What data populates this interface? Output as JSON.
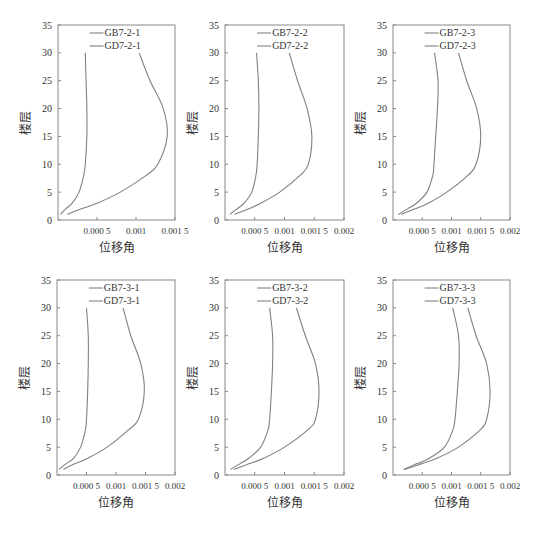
{
  "figure": {
    "y_axis_label": "楼层",
    "x_axis_label": "位移角",
    "line_color": "#808080"
  },
  "chart_data": [
    {
      "type": "line",
      "title": "",
      "xlabel": "位移角",
      "ylabel": "楼层",
      "xlim": [
        0,
        0.0015
      ],
      "ylim": [
        0,
        35
      ],
      "xticks": [
        "0.000 5",
        "0.001",
        "0.001 5"
      ],
      "xtick_values": [
        0.0005,
        0.001,
        0.0015
      ],
      "yticks": [
        "0",
        "5",
        "10",
        "15",
        "20",
        "25",
        "30",
        "35"
      ],
      "legend": [
        "GB7-2-1",
        "GD7-2-1"
      ],
      "legend_position": "upper center",
      "grid": false,
      "series": [
        {
          "name": "GB7-2-1",
          "y": [
            1,
            2,
            3,
            5,
            8,
            10,
            15,
            20,
            25,
            30
          ],
          "x": [
            3e-05,
            0.0001,
            0.00018,
            0.00027,
            0.00033,
            0.00035,
            0.00037,
            0.00037,
            0.00036,
            0.00035
          ]
        },
        {
          "name": "GD7-2-1",
          "y": [
            1,
            2,
            3,
            5,
            8,
            10,
            15,
            20,
            25,
            30
          ],
          "x": [
            0.00012,
            0.0003,
            0.0005,
            0.0008,
            0.00113,
            0.00128,
            0.0014,
            0.00135,
            0.00118,
            0.00104
          ]
        }
      ]
    },
    {
      "type": "line",
      "title": "",
      "xlabel": "位移角",
      "ylabel": "楼层",
      "xlim": [
        0,
        0.002
      ],
      "ylim": [
        0,
        35
      ],
      "xticks": [
        "0.000 5",
        "0.001",
        "0.001 5",
        "0.002"
      ],
      "xtick_values": [
        0.0005,
        0.001,
        0.0015,
        0.002
      ],
      "yticks": [
        "0",
        "5",
        "10",
        "15",
        "20",
        "25",
        "30",
        "35"
      ],
      "legend": [
        "GB7-2-2",
        "GD7-2-2"
      ],
      "legend_position": "upper center",
      "grid": false,
      "series": [
        {
          "name": "GB7-2-2",
          "y": [
            1,
            2,
            3,
            5,
            8,
            10,
            15,
            20,
            25,
            30
          ],
          "x": [
            8e-05,
            0.0002,
            0.00032,
            0.00045,
            0.00052,
            0.00054,
            0.00056,
            0.00057,
            0.00056,
            0.00053
          ]
        },
        {
          "name": "GD7-2-2",
          "y": [
            1,
            2,
            3,
            5,
            8,
            10,
            15,
            20,
            25,
            30
          ],
          "x": [
            0.00016,
            0.0004,
            0.0006,
            0.00092,
            0.00126,
            0.0014,
            0.00146,
            0.00138,
            0.00122,
            0.00108
          ]
        }
      ]
    },
    {
      "type": "line",
      "title": "",
      "xlabel": "位移角",
      "ylabel": "楼层",
      "xlim": [
        0,
        0.002
      ],
      "ylim": [
        0,
        35
      ],
      "xticks": [
        "0.000 5",
        "0.001",
        "0.001 5",
        "0.002"
      ],
      "xtick_values": [
        0.0005,
        0.001,
        0.0015,
        0.002
      ],
      "yticks": [
        "0",
        "5",
        "10",
        "15",
        "20",
        "25",
        "30",
        "35"
      ],
      "legend": [
        "GB7-2-3",
        "GD7-2-3"
      ],
      "legend_position": "upper center",
      "grid": false,
      "series": [
        {
          "name": "GB7-2-3",
          "y": [
            1,
            2,
            3,
            5,
            8,
            10,
            15,
            20,
            25,
            30
          ],
          "x": [
            9e-05,
            0.00025,
            0.0004,
            0.00058,
            0.00068,
            0.0007,
            0.00073,
            0.00076,
            0.00077,
            0.00071
          ]
        },
        {
          "name": "GD7-2-3",
          "y": [
            1,
            2,
            3,
            5,
            8,
            10,
            15,
            20,
            25,
            30
          ],
          "x": [
            0.00014,
            0.00038,
            0.0006,
            0.00092,
            0.00128,
            0.00142,
            0.0015,
            0.00143,
            0.00126,
            0.00112
          ]
        }
      ]
    },
    {
      "type": "line",
      "title": "",
      "xlabel": "位移角",
      "ylabel": "楼层",
      "xlim": [
        0,
        0.002
      ],
      "ylim": [
        0,
        35
      ],
      "xticks": [
        "0.000 5",
        "0.001",
        "0.001 5",
        "0.002"
      ],
      "xtick_values": [
        0.0005,
        0.001,
        0.0015,
        0.002
      ],
      "yticks": [
        "0",
        "5",
        "10",
        "15",
        "20",
        "25",
        "30",
        "35"
      ],
      "legend": [
        "GB7-3-1",
        "GD7-3-1"
      ],
      "legend_position": "upper center",
      "grid": false,
      "series": [
        {
          "name": "GB7-3-1",
          "y": [
            1,
            2,
            3,
            5,
            8,
            10,
            15,
            20,
            25,
            30
          ],
          "x": [
            3e-05,
            0.00015,
            0.00028,
            0.0004,
            0.00048,
            0.0005,
            0.00052,
            0.00053,
            0.00053,
            0.0005
          ]
        },
        {
          "name": "GD7-3-1",
          "y": [
            1,
            2,
            3,
            5,
            8,
            10,
            15,
            20,
            25,
            30
          ],
          "x": [
            0.00011,
            0.0003,
            0.00052,
            0.00085,
            0.0012,
            0.00138,
            0.00148,
            0.00142,
            0.00125,
            0.00112
          ]
        }
      ]
    },
    {
      "type": "line",
      "title": "",
      "xlabel": "位移角",
      "ylabel": "楼层",
      "xlim": [
        0,
        0.002
      ],
      "ylim": [
        0,
        35
      ],
      "xticks": [
        "0.000 5",
        "0.001",
        "0.001 5",
        "0.002"
      ],
      "xtick_values": [
        0.0005,
        0.001,
        0.0015,
        0.002
      ],
      "yticks": [
        "0",
        "5",
        "10",
        "15",
        "20",
        "25",
        "30",
        "35"
      ],
      "legend": [
        "GB7-3-2",
        "GD7-3-2"
      ],
      "legend_position": "upper center",
      "grid": false,
      "series": [
        {
          "name": "GB7-3-2",
          "y": [
            1,
            2,
            3,
            5,
            8,
            10,
            15,
            20,
            25,
            30
          ],
          "x": [
            9e-05,
            0.00025,
            0.0004,
            0.0006,
            0.00072,
            0.00075,
            0.00078,
            0.0008,
            0.0008,
            0.00075
          ]
        },
        {
          "name": "GD7-3-2",
          "y": [
            1,
            2,
            3,
            5,
            8,
            10,
            15,
            20,
            25,
            30
          ],
          "x": [
            0.00015,
            0.0004,
            0.00065,
            0.001,
            0.00138,
            0.00152,
            0.00158,
            0.00152,
            0.00135,
            0.0012
          ]
        }
      ]
    },
    {
      "type": "line",
      "title": "",
      "xlabel": "位移角",
      "ylabel": "楼层",
      "xlim": [
        0,
        0.002
      ],
      "ylim": [
        0,
        35
      ],
      "xticks": [
        "0.000 5",
        "0.001",
        "0.001 5",
        "0.002"
      ],
      "xtick_values": [
        0.0005,
        0.001,
        0.0015,
        0.002
      ],
      "yticks": [
        "0",
        "5",
        "10",
        "15",
        "20",
        "25",
        "30",
        "35"
      ],
      "legend": [
        "GB7-3-3",
        "GD7-3-3"
      ],
      "legend_position": "upper center",
      "grid": false,
      "series": [
        {
          "name": "GB7-3-3",
          "y": [
            1,
            2,
            3,
            5,
            8,
            10,
            15,
            20,
            25,
            30
          ],
          "x": [
            0.00018,
            0.0004,
            0.00062,
            0.00088,
            0.00102,
            0.00106,
            0.0011,
            0.00113,
            0.00112,
            0.00102
          ]
        },
        {
          "name": "GD7-3-3",
          "y": [
            1,
            2,
            3,
            5,
            8,
            10,
            15,
            20,
            25,
            30
          ],
          "x": [
            0.0002,
            0.00048,
            0.00075,
            0.00112,
            0.00148,
            0.0016,
            0.00166,
            0.0016,
            0.00142,
            0.00128
          ]
        }
      ]
    }
  ]
}
